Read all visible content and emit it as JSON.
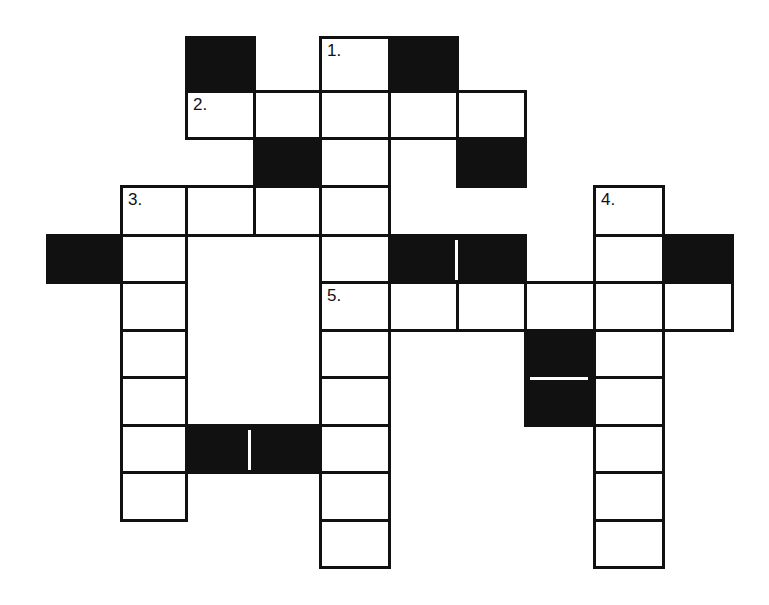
{
  "puzzle": {
    "type": "crossword",
    "colors": {
      "ink": "#111111",
      "paper": "#ffffff"
    },
    "col_edges": [
      47,
      121,
      186,
      254,
      320,
      389,
      457,
      525,
      594,
      663,
      732
    ],
    "row_edges": [
      37,
      91,
      138,
      186,
      235,
      282,
      330,
      377,
      425,
      472,
      520,
      567
    ],
    "cells": [
      {
        "r": 0,
        "c": 2,
        "t": "black"
      },
      {
        "r": 0,
        "c": 4,
        "t": "white",
        "n": "1."
      },
      {
        "r": 0,
        "c": 5,
        "t": "black"
      },
      {
        "r": 1,
        "c": 2,
        "t": "white",
        "n": "2."
      },
      {
        "r": 1,
        "c": 3,
        "t": "white"
      },
      {
        "r": 1,
        "c": 4,
        "t": "white"
      },
      {
        "r": 1,
        "c": 5,
        "t": "white"
      },
      {
        "r": 1,
        "c": 6,
        "t": "white"
      },
      {
        "r": 2,
        "c": 3,
        "t": "black"
      },
      {
        "r": 2,
        "c": 4,
        "t": "white"
      },
      {
        "r": 2,
        "c": 6,
        "t": "black"
      },
      {
        "r": 3,
        "c": 1,
        "t": "white",
        "n": "3."
      },
      {
        "r": 3,
        "c": 2,
        "t": "white"
      },
      {
        "r": 3,
        "c": 3,
        "t": "white"
      },
      {
        "r": 3,
        "c": 4,
        "t": "white"
      },
      {
        "r": 3,
        "c": 8,
        "t": "white",
        "n": "4."
      },
      {
        "r": 4,
        "c": 0,
        "t": "black"
      },
      {
        "r": 4,
        "c": 1,
        "t": "white"
      },
      {
        "r": 4,
        "c": 4,
        "t": "white"
      },
      {
        "r": 4,
        "c": 5,
        "t": "black"
      },
      {
        "r": 4,
        "c": 6,
        "t": "black"
      },
      {
        "r": 4,
        "c": 8,
        "t": "white"
      },
      {
        "r": 4,
        "c": 9,
        "t": "black"
      },
      {
        "r": 5,
        "c": 1,
        "t": "white"
      },
      {
        "r": 5,
        "c": 4,
        "t": "white",
        "n": "5."
      },
      {
        "r": 5,
        "c": 5,
        "t": "white"
      },
      {
        "r": 5,
        "c": 6,
        "t": "white"
      },
      {
        "r": 5,
        "c": 7,
        "t": "white"
      },
      {
        "r": 5,
        "c": 8,
        "t": "white"
      },
      {
        "r": 5,
        "c": 9,
        "t": "white"
      },
      {
        "r": 6,
        "c": 1,
        "t": "white"
      },
      {
        "r": 6,
        "c": 4,
        "t": "white"
      },
      {
        "r": 6,
        "c": 7,
        "t": "black"
      },
      {
        "r": 6,
        "c": 8,
        "t": "white"
      },
      {
        "r": 7,
        "c": 1,
        "t": "white"
      },
      {
        "r": 7,
        "c": 4,
        "t": "white"
      },
      {
        "r": 7,
        "c": 7,
        "t": "black"
      },
      {
        "r": 7,
        "c": 8,
        "t": "white"
      },
      {
        "r": 8,
        "c": 1,
        "t": "white"
      },
      {
        "r": 8,
        "c": 2,
        "t": "black"
      },
      {
        "r": 8,
        "c": 3,
        "t": "black"
      },
      {
        "r": 8,
        "c": 4,
        "t": "white"
      },
      {
        "r": 8,
        "c": 8,
        "t": "white"
      },
      {
        "r": 9,
        "c": 1,
        "t": "white"
      },
      {
        "r": 9,
        "c": 4,
        "t": "white"
      },
      {
        "r": 9,
        "c": 8,
        "t": "white"
      },
      {
        "r": 10,
        "c": 4,
        "t": "white"
      },
      {
        "r": 10,
        "c": 8,
        "t": "white"
      }
    ],
    "separators": [
      {
        "dir": "v",
        "x": 455,
        "y": 240,
        "len": 40
      },
      {
        "dir": "v",
        "x": 248,
        "y": 430,
        "len": 40
      },
      {
        "dir": "h",
        "x": 530,
        "y": 377,
        "len": 58
      }
    ],
    "clue_numbers": [
      "1.",
      "2.",
      "3.",
      "4.",
      "5."
    ]
  }
}
